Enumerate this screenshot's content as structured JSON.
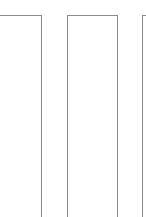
{
  "panels": [
    {
      "id": "panel-1",
      "content": ""
    },
    {
      "id": "panel-2",
      "content": ""
    },
    {
      "id": "panel-3",
      "content": ""
    }
  ],
  "colors": {
    "border": "#8a8a8a",
    "background": "#ffffff"
  }
}
